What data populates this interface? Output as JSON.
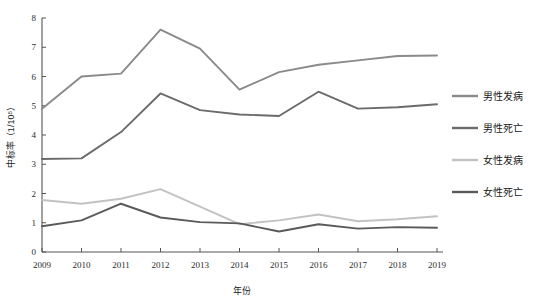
{
  "chart_data": {
    "type": "line",
    "title": "",
    "xlabel": "年份",
    "ylabel": "中标率（1/10⁵）",
    "categories": [
      "2009",
      "2010",
      "2011",
      "2012",
      "2013",
      "2014",
      "2015",
      "2016",
      "2017",
      "2018",
      "2019"
    ],
    "xlim": [
      2009,
      2019
    ],
    "ylim": [
      0,
      8
    ],
    "ytick_labels": [
      "0",
      "1",
      "2",
      "3",
      "4",
      "5",
      "6",
      "7",
      "8"
    ],
    "ytick_values": [
      0,
      1,
      2,
      3,
      4,
      5,
      6,
      7,
      8
    ],
    "grid": false,
    "legend_position": "right",
    "series": [
      {
        "name": "男性发病",
        "color": "#8a8a8a",
        "values": [
          4.9,
          6.0,
          6.1,
          7.6,
          6.95,
          5.55,
          6.15,
          6.4,
          6.55,
          6.7,
          6.72
        ]
      },
      {
        "name": "男性死亡",
        "color": "#6b6b6b",
        "values": [
          3.18,
          3.2,
          4.1,
          5.42,
          4.85,
          4.7,
          4.65,
          5.48,
          4.9,
          4.95,
          5.05
        ]
      },
      {
        "name": "女性发病",
        "color": "#c2c2c2",
        "values": [
          1.78,
          1.65,
          1.82,
          2.15,
          1.55,
          0.95,
          1.08,
          1.28,
          1.05,
          1.12,
          1.22
        ]
      },
      {
        "name": "女性死亡",
        "color": "#5a5a5a",
        "values": [
          0.88,
          1.08,
          1.65,
          1.18,
          1.02,
          0.98,
          0.7,
          0.95,
          0.8,
          0.85,
          0.83
        ]
      }
    ]
  },
  "axes": {
    "y_axis_name": "y-axis",
    "x_axis_name": "x-axis"
  }
}
